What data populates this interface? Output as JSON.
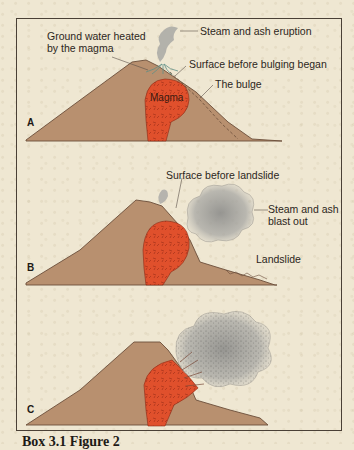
{
  "figure": {
    "caption": "Box 3.1 Figure 2",
    "colors": {
      "background": "#efe7d2",
      "ground": "#b8906f",
      "ground_outline": "#6b4e3a",
      "magma": "#e0502c",
      "magma_texture": "#a3301a",
      "steam": "#9a9a98",
      "water": "#5f8f86",
      "frame": "#4a4036"
    },
    "panels": [
      {
        "letter": "A",
        "labels": {
          "ground_water": [
            "Ground water heated",
            "by the magma"
          ],
          "steam": "Steam and ash eruption",
          "surface": "Surface before bulging began",
          "bulge": "The bulge",
          "magma": "Magma"
        }
      },
      {
        "letter": "B",
        "labels": {
          "surface": "Surface before landslide",
          "steam": [
            "Steam and ash",
            "blast out"
          ],
          "landslide": "Landslide"
        }
      },
      {
        "letter": "C",
        "labels": {}
      }
    ]
  }
}
